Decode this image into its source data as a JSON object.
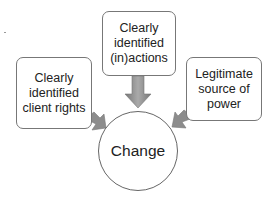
{
  "diagram": {
    "nodes": {
      "left": {
        "label": "Clearly\nidentified\nclient rights"
      },
      "top": {
        "label": "Clearly\nidentified\n(in)actions"
      },
      "right": {
        "label": "Legitimate\nsource of\npower"
      },
      "center": {
        "label": "Change"
      }
    },
    "edges": [
      {
        "from": "left",
        "to": "center"
      },
      {
        "from": "top",
        "to": "center"
      },
      {
        "from": "right",
        "to": "center"
      }
    ],
    "colors": {
      "arrow_fill": "#8a8a8a",
      "border": "#777777"
    }
  }
}
